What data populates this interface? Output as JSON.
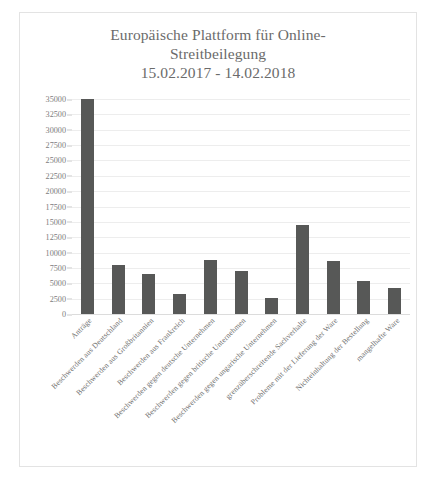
{
  "chart_data": {
    "type": "bar",
    "title_line1": "Europäische Plattform für Online-",
    "title_line2": "Streitbeilegung",
    "subtitle": "15.02.2017 - 14.02.2018",
    "xlabel": "",
    "ylabel": "",
    "ylim": [
      0,
      35000
    ],
    "ytick_step": 2500,
    "yticks": [
      "35000",
      "32500",
      "30000",
      "27500",
      "25000",
      "22500",
      "20000",
      "17500",
      "15000",
      "12500",
      "10000",
      "7500",
      "5000",
      "2500",
      "0"
    ],
    "ytick_values": [
      35000,
      32500,
      30000,
      27500,
      25000,
      22500,
      20000,
      17500,
      15000,
      12500,
      10000,
      7500,
      5000,
      2500,
      0
    ],
    "grid": true,
    "legend": "none",
    "bar_color": "#575857",
    "categories": [
      "Anträge",
      "Beschwerden aus Deutschland",
      "Beschwerden aus Großbritannien",
      "Beschwerden aus Frankreich",
      "Beschwerden gegen deutsche Unternehmen",
      "Beschwerden gegen britische Unternehmen",
      "Beschwerden gegen ungarische Unternehmen",
      "grenzüberschreitende Sachverhalte",
      "Probleme mit der Lieferung der Ware",
      "Nichteinhaltung der Bestellung",
      "mangelhafte Ware"
    ],
    "values": [
      35500,
      8000,
      6500,
      3200,
      8800,
      7000,
      2600,
      14500,
      8700,
      5300,
      4200
    ]
  },
  "theme": {
    "background": "#ffffff",
    "border_color": "#e3e3e3",
    "text_color": "#6b6b6b",
    "gridline_color": "#ededed",
    "bar_color": "#575857"
  }
}
